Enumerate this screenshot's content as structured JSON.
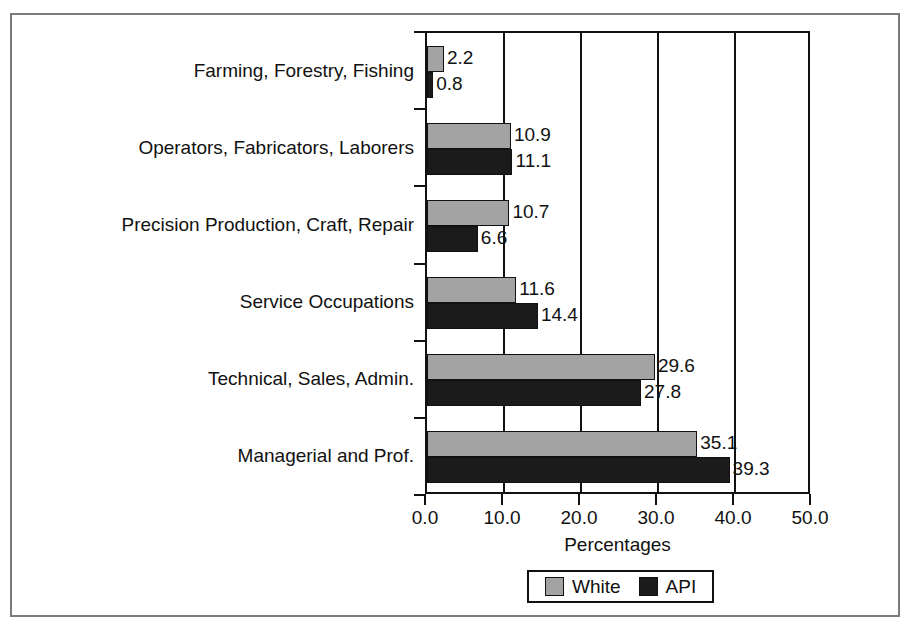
{
  "chart_data": {
    "type": "bar",
    "orientation": "horizontal",
    "title": "",
    "xlabel": "Percentages",
    "ylabel": "",
    "xlim": [
      0.0,
      50.0
    ],
    "xticks": [
      "0.0",
      "10.0",
      "20.0",
      "30.0",
      "40.0",
      "50.0"
    ],
    "xtick_values": [
      0.0,
      10.0,
      20.0,
      30.0,
      40.0,
      50.0
    ],
    "grid": true,
    "grid_axis": "x",
    "legend_position": "bottom-center",
    "categories": [
      "Farming, Forestry, Fishing",
      "Operators, Fabricators, Laborers",
      "Precision Production, Craft, Repair",
      "Service Occupations",
      "Technical, Sales, Admin.",
      "Managerial and Prof."
    ],
    "series": [
      {
        "name": "White",
        "color": "#a3a3a3",
        "values": [
          2.2,
          10.9,
          10.7,
          11.6,
          29.6,
          35.1
        ],
        "labels": [
          "2.2",
          "10.9",
          "10.7",
          "11.6",
          "29.6",
          "35.1"
        ]
      },
      {
        "name": "API",
        "color": "#1b1b1b",
        "values": [
          0.8,
          11.1,
          6.6,
          14.4,
          27.8,
          39.3
        ],
        "labels": [
          "0.8",
          "11.1",
          "6.6",
          "14.4",
          "27.8",
          "39.3"
        ]
      }
    ],
    "legend": [
      {
        "label": "White",
        "color": "#a3a3a3"
      },
      {
        "label": "API",
        "color": "#1b1b1b"
      }
    ]
  },
  "colors": {
    "white_series": "#a3a3a3",
    "api_series": "#1b1b1b",
    "axis": "#111111",
    "frame": "#7b7b7b",
    "background": "#ffffff"
  }
}
